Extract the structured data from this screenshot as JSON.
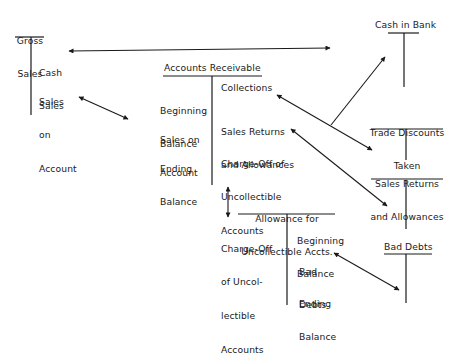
{
  "diagram": {
    "type": "t-account-flow",
    "accounts": [
      {
        "id": "gross-sales",
        "title": "Gross\nSales",
        "debit_side": [],
        "credit_side": [
          "Cash\nSales",
          "Sales\non\nAccount"
        ]
      },
      {
        "id": "cash-in-bank",
        "title": "Cash in Bank",
        "debit_side": [],
        "credit_side": []
      },
      {
        "id": "accounts-receivable",
        "title": "Accounts Receivable",
        "debit_side": [
          "Beginning\nBalance",
          "Sales on\nAccount",
          "Ending\nBalance"
        ],
        "credit_side": [
          "Collections",
          "Sales Returns\nand Allowances",
          "Charge-Off of\nUncollectible\nAccounts"
        ]
      },
      {
        "id": "trade-discounts-taken",
        "title": "Trade Discounts\nTaken",
        "debit_side": [],
        "credit_side": []
      },
      {
        "id": "sales-returns-allowances",
        "title": "Sales Returns\nand Allowances",
        "debit_side": [],
        "credit_side": []
      },
      {
        "id": "allowance-uncollectible",
        "title": "Allowance for\nUncollectible Accts.",
        "debit_side": [
          "Charge-Off\nof Uncol-\nlectible\nAccounts"
        ],
        "credit_side": [
          "Beginning\nBalance",
          "Bad\nDebts",
          "Ending\nBalance"
        ]
      },
      {
        "id": "bad-debts",
        "title": "Bad Debts",
        "debit_side": [],
        "credit_side": []
      }
    ],
    "connections": [
      {
        "from": "Gross Sales: Cash Sales",
        "to": "Cash in Bank",
        "style": "double-arrow"
      },
      {
        "from": "Gross Sales: Sales on Account",
        "to": "Accounts Receivable: Sales on Account",
        "style": "double-arrow"
      },
      {
        "from": "Accounts Receivable: Collections",
        "to": "Trade Discounts Taken",
        "style": "double-arrow"
      },
      {
        "from": "Collections branch",
        "to": "Cash in Bank",
        "style": "arrow"
      },
      {
        "from": "Accounts Receivable: Sales Returns and Allowances",
        "to": "Sales Returns and Allowances",
        "style": "double-arrow"
      },
      {
        "from": "Accounts Receivable: Charge-Off of Uncollectible Accounts",
        "to": "Allowance for Uncollectible Accts.: Charge-Off of Uncollectible Accounts",
        "style": "double-arrow"
      },
      {
        "from": "Allowance for Uncollectible Accts.: Bad Debts",
        "to": "Bad Debts",
        "style": "double-arrow"
      }
    ]
  },
  "labels": {
    "gross_sales_title_1": "Gross",
    "gross_sales_title_2": "Sales",
    "gs_cash_1": "Cash",
    "gs_cash_2": "Sales",
    "gs_onacct_1": "Sales",
    "gs_onacct_2": "on",
    "gs_onacct_3": "Account",
    "cash_bank_title": "Cash in Bank",
    "ar_title": "Accounts Receivable",
    "ar_beg_1": "Beginning",
    "ar_beg_2": "Balance",
    "ar_soa_1": "Sales on",
    "ar_soa_2": "Account",
    "ar_end_1": "Ending",
    "ar_end_2": "Balance",
    "ar_coll": "Collections",
    "ar_sra_1": "Sales Returns",
    "ar_sra_2": "and Allowances",
    "ar_co_1": "Charge-Off of",
    "ar_co_2": "Uncollectible",
    "ar_co_3": "Accounts",
    "tdt_title_1": "Trade Discounts",
    "tdt_title_2": "Taken",
    "sra_title_1": "Sales Returns",
    "sra_title_2": "and Allowances",
    "afu_title_1": "Allowance for",
    "afu_title_2": "Uncollectible Accts.",
    "afu_co_1": "Charge-Off",
    "afu_co_2": "of Uncol-",
    "afu_co_3": "lectible",
    "afu_co_4": "Accounts",
    "afu_beg_1": "Beginning",
    "afu_beg_2": "Balance",
    "afu_bd_1": "Bad",
    "afu_bd_2": "Debts",
    "afu_end_1": "Ending",
    "afu_end_2": "Balance",
    "bad_debts_title": "Bad Debts"
  },
  "colors": {
    "ink": "#1a1a1a",
    "background": "#ffffff"
  }
}
